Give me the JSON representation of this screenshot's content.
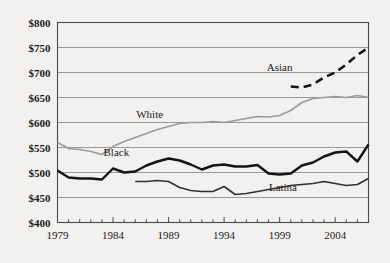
{
  "chart_data": {
    "type": "line",
    "title": "",
    "xlabel": "",
    "ylabel": "",
    "xlim": [
      1979,
      2007
    ],
    "ylim": [
      400,
      800
    ],
    "ytick_values": [
      800,
      750,
      700,
      650,
      600,
      550,
      500,
      450,
      400
    ],
    "ytick_labels": [
      "$800",
      "$750",
      "$700",
      "$650",
      "$600",
      "$550",
      "$500",
      "$450",
      "$400"
    ],
    "xtick_values": [
      1979,
      1984,
      1989,
      1994,
      1999,
      2004
    ],
    "xtick_labels": [
      "1979",
      "1984",
      "1989",
      "1994",
      "1999",
      "2004"
    ],
    "minor_xticks_every": 1,
    "grid": "horizontal",
    "legend": "inline-labels",
    "series": [
      {
        "name": "Asian",
        "label": "Asian",
        "color": "#141414",
        "style": "dashed",
        "width": 2.6,
        "label_x": 1999.0,
        "label_y": 712,
        "x": [
          2000,
          2001,
          2002,
          2003,
          2004,
          2005,
          2006,
          2007
        ],
        "values": [
          672,
          670,
          676,
          690,
          700,
          716,
          735,
          750
        ]
      },
      {
        "name": "White",
        "label": "White",
        "color": "#9a9a9a",
        "style": "solid",
        "width": 1.6,
        "label_x": 1987.3,
        "label_y": 618,
        "x": [
          1979,
          1980,
          1981,
          1982,
          1983,
          1984,
          1985,
          1986,
          1987,
          1988,
          1989,
          1990,
          1991,
          1992,
          1993,
          1994,
          1995,
          1996,
          1997,
          1998,
          1999,
          2000,
          2001,
          2002,
          2003,
          2004,
          2005,
          2006,
          2007
        ],
        "values": [
          560,
          548,
          546,
          542,
          536,
          552,
          562,
          570,
          578,
          586,
          592,
          598,
          600,
          600,
          602,
          600,
          604,
          608,
          612,
          611,
          614,
          624,
          640,
          648,
          650,
          652,
          650,
          654,
          650
        ]
      },
      {
        "name": "Black",
        "label": "Black",
        "color": "#141414",
        "style": "solid",
        "width": 2.4,
        "label_x": 1984.3,
        "label_y": 542,
        "x": [
          1979,
          1980,
          1981,
          1982,
          1983,
          1984,
          1985,
          1986,
          1987,
          1988,
          1989,
          1990,
          1991,
          1992,
          1993,
          1994,
          1995,
          1996,
          1997,
          1998,
          1999,
          2000,
          2001,
          2002,
          2003,
          2004,
          2005,
          2006,
          2007
        ],
        "values": [
          504,
          490,
          488,
          488,
          486,
          508,
          500,
          502,
          514,
          522,
          528,
          524,
          516,
          506,
          514,
          516,
          512,
          512,
          515,
          498,
          496,
          498,
          514,
          520,
          532,
          540,
          542,
          522,
          556
        ]
      },
      {
        "name": "Latina",
        "label": "Latina",
        "color": "#303030",
        "style": "solid",
        "width": 1.6,
        "label_x": 1999.3,
        "label_y": 472,
        "x": [
          1986,
          1987,
          1988,
          1989,
          1990,
          1991,
          1992,
          1993,
          1994,
          1995,
          1996,
          1997,
          1998,
          1999,
          2000,
          2001,
          2002,
          2003,
          2004,
          2005,
          2006,
          2007
        ],
        "values": [
          482,
          482,
          484,
          482,
          470,
          464,
          462,
          462,
          472,
          456,
          458,
          462,
          466,
          470,
          474,
          476,
          478,
          482,
          478,
          474,
          476,
          488
        ]
      }
    ]
  }
}
